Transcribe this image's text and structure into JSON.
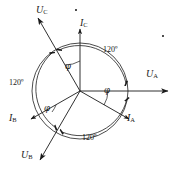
{
  "diagram": {
    "type": "phasor",
    "origin": {
      "x": 80,
      "y": 91
    },
    "circle_radius": 48,
    "stroke_color": "#1a1a1a",
    "background": "#ffffff",
    "phase_separation_deg": 120,
    "power_factor_angle_deg": 30,
    "vectors": [
      {
        "key": "UA",
        "symbol": "U",
        "subscript": "A",
        "dotted": true,
        "angle_deg": 0,
        "length": 88,
        "label_x": 146,
        "label_y": 69
      },
      {
        "key": "UB",
        "symbol": "U",
        "subscript": "B",
        "dotted": true,
        "angle_deg": 240,
        "length": 80,
        "label_x": 21,
        "label_y": 150
      },
      {
        "key": "UC",
        "symbol": "U",
        "subscript": "C",
        "dotted": true,
        "angle_deg": 120,
        "length": 84,
        "label_x": 36,
        "label_y": 5
      },
      {
        "key": "IA",
        "symbol": "I",
        "subscript": "A",
        "dotted": true,
        "angle_deg": -30,
        "length": 57,
        "label_x": 127,
        "label_y": 113
      },
      {
        "key": "IB",
        "symbol": "I",
        "subscript": "B",
        "dotted": true,
        "angle_deg": 210,
        "length": 57,
        "label_x": 9,
        "label_y": 113
      },
      {
        "key": "IC",
        "symbol": "I",
        "subscript": "C",
        "dotted": true,
        "angle_deg": 90,
        "length": 62,
        "label_x": 80,
        "label_y": 18
      }
    ],
    "angle_labels": [
      {
        "key": "phi-a",
        "text": "φ",
        "x": 104,
        "y": 86
      },
      {
        "key": "phi-b",
        "text": "φ",
        "x": 44,
        "y": 104
      },
      {
        "key": "phi-c",
        "text": "φ",
        "x": 65,
        "y": 62
      },
      {
        "key": "sep-top-right",
        "text": "120º",
        "x": 103,
        "y": 46
      },
      {
        "key": "sep-left",
        "text": "120º",
        "x": 9,
        "y": 79
      },
      {
        "key": "sep-bottom",
        "text": "120º",
        "x": 82,
        "y": 134
      }
    ]
  }
}
